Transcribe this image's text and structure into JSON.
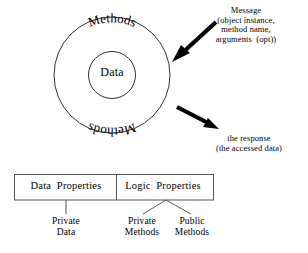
{
  "diagram": {
    "colors": {
      "stroke": "#1a1a1a",
      "arrow": "#000000",
      "box_border": "#555555",
      "background": "#ffffff"
    },
    "circle": {
      "inner_label": "Data",
      "outer_label_top": "Methods",
      "outer_label_bottom": "Methods"
    },
    "annotations": {
      "message": {
        "lines": [
          "Message",
          "(object instance,",
          "method name,",
          "arguments  (opt))"
        ],
        "text": "Message\n(object instance,\nmethod name,\narguments  (opt))"
      },
      "response": {
        "lines": [
          "the response",
          "(the accessed data)"
        ],
        "text": "the response\n(the accessed data)"
      }
    },
    "boxes": [
      {
        "id": "data-properties",
        "label": "Data  Properties"
      },
      {
        "id": "logic-properties",
        "label": "Logic  Properties"
      }
    ],
    "leaves": [
      {
        "id": "private-data",
        "label": "Private\nData",
        "parent": "data-properties"
      },
      {
        "id": "private-methods",
        "label": "Private\nMethods",
        "parent": "logic-properties"
      },
      {
        "id": "public-methods",
        "label": "Public\nMethods",
        "parent": "logic-properties"
      }
    ]
  }
}
